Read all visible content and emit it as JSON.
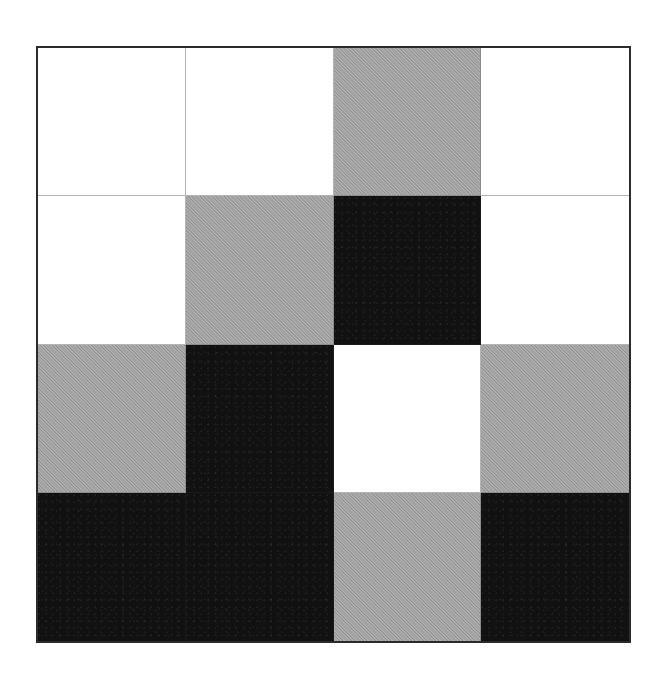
{
  "figure": {
    "type": "grid-pattern",
    "rows": 4,
    "columns": 4,
    "palette": {
      "white": "#ffffff",
      "gray": "#9e9e9e",
      "black": "#111111",
      "border": "#2b2b2b",
      "gridline": "#b4b4b4",
      "background": "#ffffff"
    },
    "tone_names": [
      "white",
      "gray",
      "black"
    ],
    "cells": [
      [
        {
          "row": 1,
          "col": 1,
          "tone": "white"
        },
        {
          "row": 1,
          "col": 2,
          "tone": "white"
        },
        {
          "row": 1,
          "col": 3,
          "tone": "gray"
        },
        {
          "row": 1,
          "col": 4,
          "tone": "white"
        }
      ],
      [
        {
          "row": 2,
          "col": 1,
          "tone": "white"
        },
        {
          "row": 2,
          "col": 2,
          "tone": "gray"
        },
        {
          "row": 2,
          "col": 3,
          "tone": "black"
        },
        {
          "row": 2,
          "col": 4,
          "tone": "white"
        }
      ],
      [
        {
          "row": 3,
          "col": 1,
          "tone": "gray"
        },
        {
          "row": 3,
          "col": 2,
          "tone": "black"
        },
        {
          "row": 3,
          "col": 3,
          "tone": "white"
        },
        {
          "row": 3,
          "col": 4,
          "tone": "gray"
        }
      ],
      [
        {
          "row": 4,
          "col": 1,
          "tone": "black"
        },
        {
          "row": 4,
          "col": 2,
          "tone": "black"
        },
        {
          "row": 4,
          "col": 3,
          "tone": "gray"
        },
        {
          "row": 4,
          "col": 4,
          "tone": "black"
        }
      ]
    ],
    "tone_counts": {
      "white": 7,
      "gray": 5,
      "black": 4
    }
  },
  "chart_data": {
    "type": "heatmap",
    "title": "",
    "xlabel": "",
    "ylabel": "",
    "categories": [
      "1",
      "2",
      "3",
      "4"
    ],
    "row_labels": [
      "1",
      "2",
      "3",
      "4"
    ],
    "column_labels": [
      "1",
      "2",
      "3",
      "4"
    ],
    "value_scale": {
      "white": 0,
      "gray": 1,
      "black": 2
    },
    "values": [
      [
        0,
        0,
        1,
        0
      ],
      [
        0,
        1,
        2,
        0
      ],
      [
        1,
        2,
        0,
        1
      ],
      [
        2,
        2,
        1,
        2
      ]
    ],
    "colors": [
      "#ffffff",
      "#9e9e9e",
      "#111111"
    ],
    "grid": true,
    "legend": "none"
  }
}
